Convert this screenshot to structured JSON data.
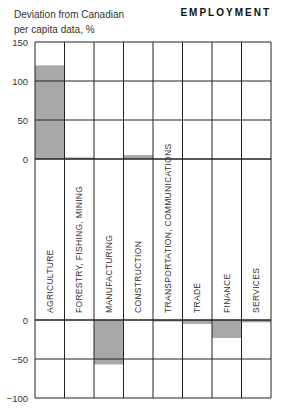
{
  "chart_data": {
    "type": "bar",
    "title": "EMPLOYMENT",
    "ylabel": "Deviation from Canadian per capita data, %",
    "xlabel": "",
    "categories": [
      "AGRICULTURE",
      "FORESTRY, FISHING, MINING",
      "MANUFACTURING",
      "CONSTRUCTION",
      "TRANSPORTATION, COMMUNICATIONS",
      "TRADE",
      "FINANCE",
      "SERVICES"
    ],
    "values": [
      120,
      2,
      -57,
      5,
      -2,
      -5,
      -23,
      -3
    ],
    "upper_yticks": [
      150,
      100,
      50,
      0
    ],
    "lower_yticks": [
      0,
      -50,
      -100
    ],
    "ylim_upper": [
      0,
      150
    ],
    "ylim_lower": [
      -100,
      0
    ],
    "grid": true,
    "bar_color": "#a8a8a8",
    "legend": null
  },
  "header": {
    "ylabel_line1": "Deviation from Canadian",
    "ylabel_line2": "per capita data, %",
    "title": "EMPLOYMENT"
  }
}
